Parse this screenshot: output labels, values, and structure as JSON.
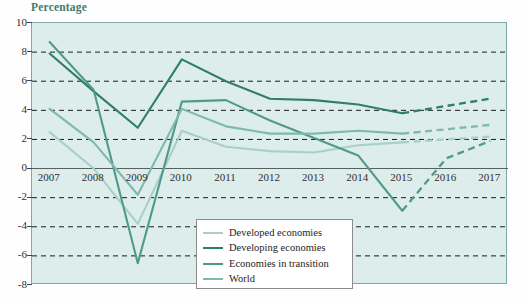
{
  "axis_caption": "Percentage",
  "colors": {
    "developed": "#a9cfc8",
    "developing": "#2f7f66",
    "transition": "#4f9b88",
    "world": "#7fb8ad",
    "plot_background": "#dcedeb",
    "grid": "#1b1b1b",
    "frame": "#7fa9a3",
    "caption": "#3f7a6e"
  },
  "legend": {
    "items": [
      {
        "label": "Developed economies",
        "color": "#a9cfc8"
      },
      {
        "label": "Developing economies",
        "color": "#2f7f66"
      },
      {
        "label": "Economies in transition",
        "color": "#4f9b88"
      },
      {
        "label": "World",
        "color": "#7fb8ad"
      }
    ]
  },
  "chart_data": {
    "type": "line",
    "title": "",
    "xlabel": "",
    "ylabel": "Percentage",
    "xlim": [
      2006.6,
      2017.4
    ],
    "ylim": [
      -8,
      10
    ],
    "yticks": [
      10,
      8,
      6,
      4,
      2,
      0,
      -2,
      -4,
      -6,
      -8
    ],
    "ytick_labels": [
      "10",
      "8",
      "6",
      "4",
      "2",
      "0",
      "-2",
      "-4",
      "-6",
      "-8"
    ],
    "grid": "horizontal-dashed",
    "legend_position": "bottom-center",
    "forecast_start": 2015,
    "forecast_style": "dashed",
    "x": [
      2007,
      2008,
      2009,
      2010,
      2011,
      2012,
      2013,
      2014,
      2015,
      2016,
      2017
    ],
    "categories": [
      "2007",
      "2008",
      "2009",
      "2010",
      "2011",
      "2012",
      "2013",
      "2014",
      "2015",
      "2016",
      "2017"
    ],
    "series": [
      {
        "name": "Developed economies",
        "color": "#a9cfc8",
        "values": [
          2.5,
          0.0,
          -3.8,
          2.6,
          1.5,
          1.2,
          1.1,
          1.6,
          1.8,
          2.0,
          2.2
        ]
      },
      {
        "name": "Developing economies",
        "color": "#2f7f66",
        "values": [
          7.9,
          5.3,
          2.8,
          7.5,
          6.0,
          4.8,
          4.7,
          4.4,
          3.8,
          4.3,
          4.8
        ]
      },
      {
        "name": "Economies in transition",
        "color": "#4f9b88",
        "values": [
          8.7,
          5.4,
          -6.5,
          4.6,
          4.7,
          3.3,
          2.1,
          0.9,
          -2.9,
          0.7,
          1.9
        ]
      },
      {
        "name": "World",
        "color": "#7fb8ad",
        "values": [
          4.1,
          1.8,
          -1.8,
          4.1,
          2.9,
          2.4,
          2.4,
          2.6,
          2.4,
          2.7,
          3.0
        ]
      }
    ]
  }
}
